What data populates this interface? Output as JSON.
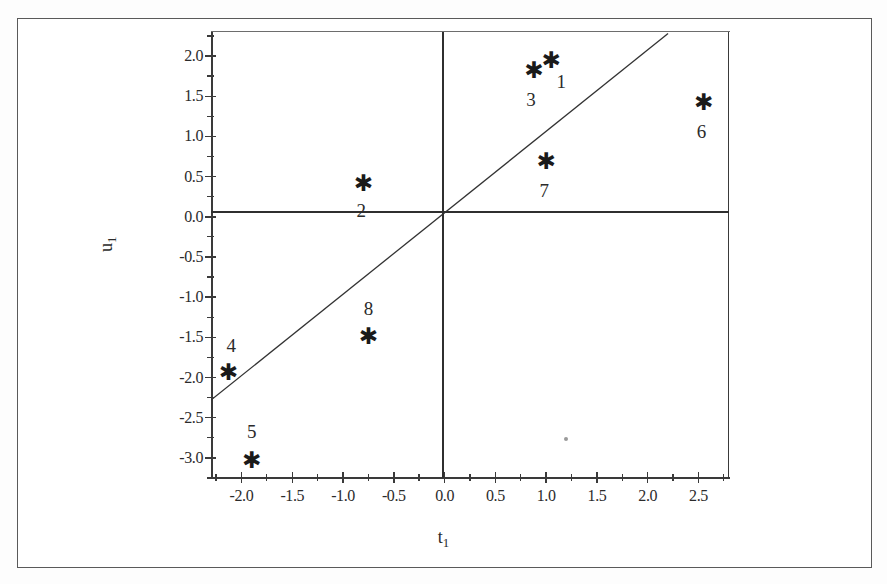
{
  "figure": {
    "background_color": "#ffffff",
    "frame_color": "#5a5a5a",
    "axis_color": "#2f2f2f",
    "marker_color": "#1a1a1a"
  },
  "axes": {
    "x_title_base": "t",
    "x_title_sub": "1",
    "y_title_base": "u",
    "y_title_sub": "1",
    "x_tick_labels": [
      "-2.0",
      "-1.5",
      "-1.0",
      "-0.5",
      "0.0",
      "0.5",
      "1.0",
      "1.5",
      "2.0",
      "2.5"
    ],
    "y_tick_labels": [
      "2.0",
      "1.5",
      "1.0",
      "0.5",
      "0.0",
      "-0.5",
      "-1.0",
      "-1.5",
      "-2.0",
      "-2.5",
      "-3.0"
    ]
  },
  "chart_data": {
    "type": "scatter",
    "title": "",
    "xlabel": "t1",
    "ylabel": "u1",
    "xlim": [
      -2.3,
      2.8
    ],
    "ylim": [
      -3.25,
      2.3
    ],
    "xticks": [
      -2.0,
      -1.5,
      -1.0,
      -0.5,
      0.0,
      0.5,
      1.0,
      1.5,
      2.0,
      2.5
    ],
    "yticks": [
      2.0,
      1.5,
      1.0,
      0.5,
      0.0,
      -0.5,
      -1.0,
      -1.5,
      -2.0,
      -2.5,
      -3.0
    ],
    "minor_tick_step": 0.25,
    "grid": false,
    "legend": false,
    "marker_symbol": "asterisk",
    "points": [
      {
        "label": "1",
        "x": 1.05,
        "y": 1.95,
        "label_dx": 10,
        "label_dy": 22
      },
      {
        "label": "2",
        "x": -0.8,
        "y": 0.42,
        "label_dx": -2,
        "label_dy": 28
      },
      {
        "label": "3",
        "x": 0.88,
        "y": 1.83,
        "label_dx": -3,
        "label_dy": 30
      },
      {
        "label": "4",
        "x": -2.13,
        "y": -1.93,
        "label_dx": 3,
        "label_dy": -26
      },
      {
        "label": "5",
        "x": -1.9,
        "y": -3.03,
        "label_dx": 0,
        "label_dy": -28
      },
      {
        "label": "6",
        "x": 2.55,
        "y": 1.43,
        "label_dx": -2,
        "label_dy": 30
      },
      {
        "label": "7",
        "x": 1.0,
        "y": 0.7,
        "label_dx": -2,
        "label_dy": 30
      },
      {
        "label": "8",
        "x": -0.75,
        "y": -1.48,
        "label_dx": 0,
        "label_dy": -27
      }
    ],
    "stray_marks": [
      {
        "x": 1.2,
        "y": -2.76
      }
    ],
    "reference_line": {
      "description": "diagonal line through origin",
      "x_start": -2.3,
      "y_start": -2.28,
      "x_end": 2.2,
      "y_end": 2.28
    }
  }
}
